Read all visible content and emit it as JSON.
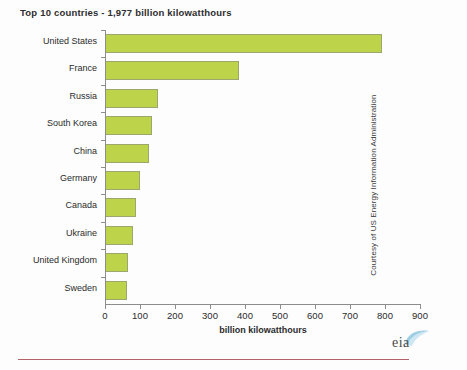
{
  "chart_data": {
    "type": "bar",
    "orientation": "horizontal",
    "title": "Top 10 countries - 1,977 billion kilowatthours",
    "xlabel": "billion kilowatthours",
    "ylabel": "",
    "xlim": [
      0,
      900
    ],
    "xticks": [
      0,
      100,
      200,
      300,
      400,
      500,
      600,
      700,
      800,
      900
    ],
    "xtick_labels": [
      "0",
      "100",
      "200",
      "300",
      "400",
      "500",
      "600",
      "700",
      "800",
      "900"
    ],
    "grid": false,
    "legend": null,
    "bar_color": "#bdd44a",
    "bar_border_color": "#9aa86e",
    "categories": [
      "United States",
      "France",
      "Russia",
      "South Korea",
      "China",
      "Germany",
      "Canada",
      "Ukraine",
      "United Kingdom",
      "Sweden"
    ],
    "values": [
      790,
      383,
      150,
      135,
      125,
      100,
      88,
      80,
      65,
      62
    ],
    "units": "billion kilowatthours"
  },
  "credit": {
    "text": "Courtesy of US Energy Information Administration"
  },
  "logo": {
    "name": "eia-logo",
    "text": "eia"
  }
}
